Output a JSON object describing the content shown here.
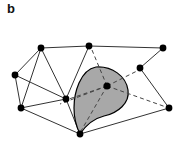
{
  "figure": {
    "panel_label": "b",
    "background_color": "#ffffff",
    "ink_color": "#1a1a1a",
    "region_fill_color": "#a8a8a8",
    "region_stroke_color": "#000000",
    "node_color": "#000000",
    "solid_edge_color": "#333333",
    "dashed_edge_color": "#444444"
  },
  "diagram_data": {
    "type": "mesh-graph",
    "description": "Triangulated point mesh in perspective with one shaded natural-neighbour region around an interior node",
    "view_box": "0 0 185 155",
    "node_radius": 3.4,
    "nodes": [
      {
        "id": "n1",
        "name": "top-left-node",
        "x": 41,
        "y": 48
      },
      {
        "id": "n2",
        "name": "top-middle-node",
        "x": 89,
        "y": 46
      },
      {
        "id": "n3",
        "name": "top-right-node",
        "x": 163,
        "y": 48
      },
      {
        "id": "n4",
        "name": "left-upper-node",
        "x": 15,
        "y": 75
      },
      {
        "id": "n5",
        "name": "right-middle-node",
        "x": 140,
        "y": 68
      },
      {
        "id": "n6",
        "name": "left-lower-node",
        "x": 21,
        "y": 108
      },
      {
        "id": "n7",
        "name": "center-left-node",
        "x": 66,
        "y": 99
      },
      {
        "id": "n8",
        "name": "interior-node",
        "x": 107,
        "y": 86
      },
      {
        "id": "n9",
        "name": "bottom-node",
        "x": 80,
        "y": 134
      },
      {
        "id": "n10",
        "name": "bottom-right-node",
        "x": 169,
        "y": 108
      }
    ],
    "solid_edges": [
      {
        "from": "n1",
        "to": "n2"
      },
      {
        "from": "n2",
        "to": "n3"
      },
      {
        "from": "n3",
        "to": "n5"
      },
      {
        "from": "n1",
        "to": "n4"
      },
      {
        "from": "n1",
        "to": "n6"
      },
      {
        "from": "n1",
        "to": "n7"
      },
      {
        "from": "n4",
        "to": "n6"
      },
      {
        "from": "n4",
        "to": "n7"
      },
      {
        "from": "n6",
        "to": "n7"
      },
      {
        "from": "n2",
        "to": "n7"
      },
      {
        "from": "n5",
        "to": "n10"
      },
      {
        "from": "n6",
        "to": "n9"
      },
      {
        "from": "n9",
        "to": "n10"
      },
      {
        "from": "n7",
        "to": "n9"
      }
    ],
    "dashed_edges": [
      {
        "from": "n8",
        "to": "n2"
      },
      {
        "from": "n8",
        "to": "n5"
      },
      {
        "from": "n8",
        "to": "n10"
      },
      {
        "from": "n8",
        "to": "n9"
      },
      {
        "from": "n8",
        "to": "n7"
      },
      {
        "from": "n8",
        "to": "n6"
      }
    ],
    "shaded_region": {
      "name": "natural-neighbour-cell",
      "contains_node": "n8",
      "fill": "#a8a8a8",
      "outline": "#000000",
      "path": "M 96 67 C 112 66 126 76 128 90 C 130 103 118 113 104 116 C 92 119 84 128 80 134 C 77 128 74 118 74 108 C 74 93 80 70 96 67 Z"
    }
  }
}
